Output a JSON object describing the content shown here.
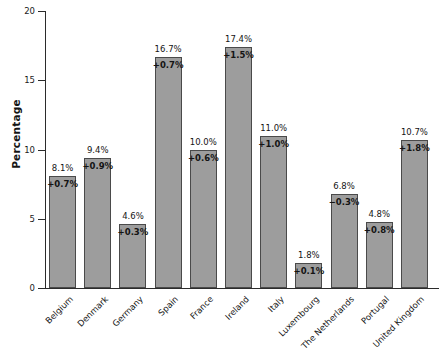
{
  "chart_data": {
    "type": "bar",
    "title": "",
    "xlabel": "",
    "ylabel": "Percentage",
    "ylim": [
      0,
      20
    ],
    "yticks": [
      0,
      5,
      10,
      15,
      20
    ],
    "ytick_labels": [
      "0",
      "5",
      "10",
      "15",
      "20"
    ],
    "grid": false,
    "legend": "none",
    "bar_color": "#9d9d9d",
    "bar_edge_color": "#4a4a4a",
    "categories": [
      "Belgium",
      "Denmark",
      "Germany",
      "Spain",
      "France",
      "Ireland",
      "Italy",
      "Luxembourg",
      "The Netherlands",
      "Portugal",
      "United Kingdom"
    ],
    "values": [
      8.1,
      9.4,
      4.6,
      16.7,
      10.0,
      17.4,
      11.0,
      1.8,
      6.8,
      4.8,
      10.7
    ],
    "value_labels": [
      "8.1%",
      "9.4%",
      "4.6%",
      "16.7%",
      "10.0%",
      "17.4%",
      "11.0%",
      "1.8%",
      "6.8%",
      "4.8%",
      "10.7%"
    ],
    "delta_values": [
      0.7,
      0.9,
      0.3,
      0.7,
      0.6,
      1.5,
      1.0,
      0.1,
      -0.3,
      0.8,
      1.8
    ],
    "delta_labels": [
      "+0.7%",
      "+0.9%",
      "+0.3%",
      "+0.7%",
      "+0.6%",
      "+1.5%",
      "+1.0%",
      "+0.1%",
      "−0.3%",
      "+0.8%",
      "+1.8%"
    ]
  }
}
